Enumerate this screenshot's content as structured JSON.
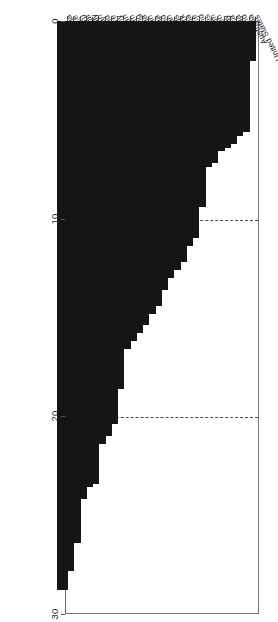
{
  "chart_data": {
    "type": "bar",
    "orientation": "horizontal",
    "title": "",
    "subtitle": "",
    "xlabel": "",
    "ylabel": "",
    "xlim": [
      0,
      30
    ],
    "x_ticks": [
      0,
      10,
      20,
      30
    ],
    "x_tick_labels": [
      "0",
      "10",
      "20",
      "30"
    ],
    "grid": "vertical-dashed-at-10-and-20",
    "legend": "none",
    "bar_color": "#151515",
    "background_color": "#ffffff",
    "axis_color": "#777777",
    "categories": [
      "United States",
      "Australia",
      "Ireland",
      "Canada",
      "South Africa",
      "Norway",
      "Sweden",
      "United Kingdom",
      "Philippines",
      "Finland",
      "France",
      "Malaysia",
      "Denmark",
      "Netherlands",
      "Pakistan",
      "Thailand",
      "Indonesia",
      "Spain",
      "India",
      "Hong Kong",
      "Belgium",
      "Japan",
      "Germany",
      "Singapore",
      "Switzerland",
      "Taiwan",
      "Italy",
      "Portugal",
      "Korea (South)",
      "Greece",
      "Austria"
    ],
    "values": [
      2.0,
      5.6,
      5.8,
      6.2,
      6.4,
      6.6,
      7.2,
      7.4,
      9.4,
      11.0,
      11.4,
      12.2,
      12.6,
      13.0,
      13.6,
      14.4,
      14.8,
      15.4,
      15.8,
      16.2,
      16.6,
      18.6,
      20.4,
      21.0,
      21.4,
      23.4,
      23.6,
      24.2,
      26.4,
      27.8,
      28.8
    ]
  }
}
